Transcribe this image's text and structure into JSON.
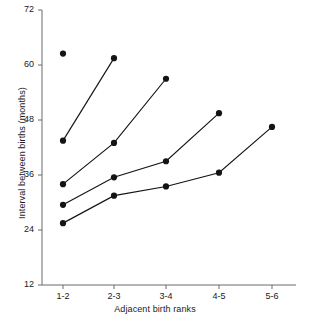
{
  "chart_data": {
    "type": "line",
    "title": "",
    "xlabel": "Adjacent birth ranks",
    "ylabel": "Interval between births (months)",
    "categories": [
      "1-2",
      "2-3",
      "3-4",
      "4-5",
      "5-6"
    ],
    "yticks": [
      12,
      24,
      36,
      48,
      60,
      72
    ],
    "ylim": [
      12,
      72
    ],
    "grid": false,
    "legend": "none",
    "marker": "filled-circle",
    "series": [
      {
        "name": "series-1",
        "x": [
          "1-2",
          "2-3"
        ],
        "values": [
          43.5,
          61.5
        ]
      },
      {
        "name": "series-2",
        "x": [
          "1-2",
          "2-3",
          "3-4"
        ],
        "values": [
          34.0,
          43.0,
          57.0
        ]
      },
      {
        "name": "series-3",
        "x": [
          "1-2",
          "2-3",
          "3-4",
          "4-5"
        ],
        "values": [
          29.5,
          35.5,
          39.0,
          49.5
        ]
      },
      {
        "name": "series-4",
        "x": [
          "1-2",
          "2-3",
          "3-4",
          "4-5",
          "5-6"
        ],
        "values": [
          25.5,
          31.5,
          33.5,
          36.5,
          46.5
        ]
      }
    ],
    "isolated_points": [
      {
        "name": "isolated-point-1",
        "x": "1-2",
        "value": 62.5
      }
    ]
  },
  "axis": {
    "y_tick_labels": [
      "12",
      "24",
      "36",
      "48",
      "60",
      "72"
    ],
    "x_tick_labels": [
      "1-2",
      "2-3",
      "3-4",
      "4-5",
      "5-6"
    ],
    "y_title": "Interval between births (months)",
    "x_title": "Adjacent birth ranks"
  },
  "colors": {
    "axis": "#6b6b6b",
    "data": "#141414",
    "background": "#ffffff"
  }
}
